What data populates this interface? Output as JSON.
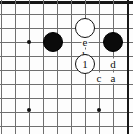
{
  "diagram": {
    "type": "go-board-diagram",
    "width": 133,
    "height": 134,
    "grid": {
      "spacing": 14,
      "vertical_lines_x": [
        1,
        15,
        29,
        43,
        57,
        71,
        85,
        99,
        113,
        127
      ],
      "horizontal_lines_y": [
        2,
        14,
        28,
        42,
        56,
        70,
        84,
        98,
        112,
        126
      ],
      "edges": [
        {
          "side": "top",
          "y": 2
        },
        {
          "side": "right",
          "x": 127
        }
      ]
    },
    "star_points": [
      {
        "x": 29,
        "y": 42
      },
      {
        "x": 29,
        "y": 110
      },
      {
        "x": 99,
        "y": 110
      }
    ],
    "stones": [
      {
        "color": "black",
        "x": 53,
        "y": 42,
        "label": ""
      },
      {
        "color": "black",
        "x": 113,
        "y": 42,
        "label": ""
      },
      {
        "color": "white",
        "x": 85,
        "y": 28,
        "label": ""
      },
      {
        "color": "white",
        "x": 85,
        "y": 64,
        "label": "1"
      }
    ],
    "point_labels": [
      {
        "text": "e",
        "x": 85,
        "y": 42
      },
      {
        "text": "b",
        "x": 85,
        "y": 55
      },
      {
        "text": "d",
        "x": 113,
        "y": 64
      },
      {
        "text": "c",
        "x": 99,
        "y": 78
      },
      {
        "text": "a",
        "x": 113,
        "y": 78
      }
    ],
    "colors": {
      "grid": "#6f6f6f",
      "edge": "#171717",
      "black_stone": "#0b0b0b",
      "white_stone": "#ffffff",
      "label_text": "#111111",
      "background": "#fdfdfd"
    }
  }
}
